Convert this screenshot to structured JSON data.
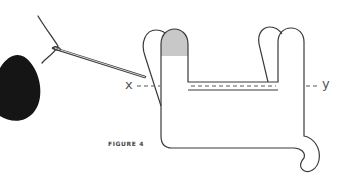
{
  "figure": {
    "caption": "FIGURE 4",
    "point_labels": {
      "left": "x",
      "right": "y"
    }
  },
  "colors": {
    "outline": "#3a3a3a",
    "tip_fill": "#c8c8c8",
    "yarn": "#151515",
    "background": "#ffffff"
  },
  "icons": [
    "yarn-ball-icon",
    "needle-icon"
  ]
}
